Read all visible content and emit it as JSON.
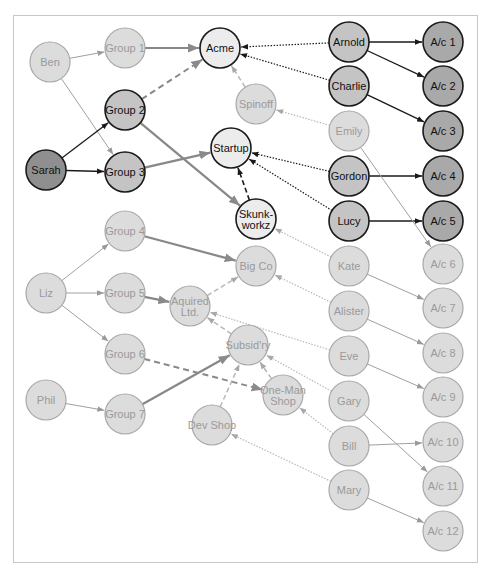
{
  "colors": {
    "dark_fill": "#8f8f8f",
    "medium_fill": "#c4c4c4",
    "light_fill": "#ececec",
    "faded_fill": "#dcdcdc",
    "faded_stroke": "#a8a8a8",
    "faded_text": "#9a9a9a",
    "strong_stroke": "#1a1a1a",
    "edge_gray": "#888888",
    "edge_light": "#b8b8b8"
  },
  "nodes": [
    {
      "id": "ben",
      "label": "Ben",
      "x": 50,
      "y": 62,
      "style": "faded"
    },
    {
      "id": "group1",
      "label": "Group 1",
      "x": 125,
      "y": 48,
      "style": "faded"
    },
    {
      "id": "acme",
      "label": "Acme",
      "x": 220,
      "y": 48,
      "style": "light"
    },
    {
      "id": "group2",
      "label": "Group 2",
      "x": 125,
      "y": 110,
      "style": "medium"
    },
    {
      "id": "sarah",
      "label": "Sarah",
      "x": 46,
      "y": 170,
      "style": "dark"
    },
    {
      "id": "group3",
      "label": "Group 3",
      "x": 125,
      "y": 172,
      "style": "medium"
    },
    {
      "id": "spinoff",
      "label": "Spinoff",
      "x": 256,
      "y": 104,
      "style": "faded"
    },
    {
      "id": "startup",
      "label": "Startup",
      "x": 231,
      "y": 148,
      "style": "light"
    },
    {
      "id": "skunkworkz",
      "label": "Skunk-|workz",
      "x": 256,
      "y": 219,
      "style": "light"
    },
    {
      "id": "arnold",
      "label": "Arnold",
      "x": 349,
      "y": 42,
      "style": "medium"
    },
    {
      "id": "charlie",
      "label": "Charlie",
      "x": 349,
      "y": 86,
      "style": "medium"
    },
    {
      "id": "emily",
      "label": "Emily",
      "x": 349,
      "y": 131,
      "style": "faded"
    },
    {
      "id": "gordon",
      "label": "Gordon",
      "x": 349,
      "y": 176,
      "style": "medium"
    },
    {
      "id": "lucy",
      "label": "Lucy",
      "x": 349,
      "y": 221,
      "style": "medium"
    },
    {
      "id": "kate",
      "label": "Kate",
      "x": 349,
      "y": 266,
      "style": "faded"
    },
    {
      "id": "alister",
      "label": "Alister",
      "x": 349,
      "y": 311,
      "style": "faded"
    },
    {
      "id": "eve",
      "label": "Eve",
      "x": 349,
      "y": 356,
      "style": "faded"
    },
    {
      "id": "gary",
      "label": "Gary",
      "x": 349,
      "y": 401,
      "style": "faded"
    },
    {
      "id": "bill",
      "label": "Bill",
      "x": 349,
      "y": 446,
      "style": "faded"
    },
    {
      "id": "mary",
      "label": "Mary",
      "x": 349,
      "y": 490,
      "style": "faded"
    },
    {
      "id": "ac1",
      "label": "A/c 1",
      "x": 443,
      "y": 42,
      "style": "accdark"
    },
    {
      "id": "ac2",
      "label": "A/c 2",
      "x": 443,
      "y": 86,
      "style": "accdark"
    },
    {
      "id": "ac3",
      "label": "A/c 3",
      "x": 443,
      "y": 131,
      "style": "accdark"
    },
    {
      "id": "ac4",
      "label": "A/c 4",
      "x": 443,
      "y": 176,
      "style": "accdark"
    },
    {
      "id": "ac5",
      "label": "A/c 5",
      "x": 443,
      "y": 221,
      "style": "accdark"
    },
    {
      "id": "ac6",
      "label": "A/c 6",
      "x": 443,
      "y": 264,
      "style": "faded"
    },
    {
      "id": "ac7",
      "label": "A/c 7",
      "x": 443,
      "y": 308,
      "style": "faded"
    },
    {
      "id": "ac8",
      "label": "A/c 8",
      "x": 443,
      "y": 353,
      "style": "faded"
    },
    {
      "id": "ac9",
      "label": "A/c 9",
      "x": 443,
      "y": 397,
      "style": "faded"
    },
    {
      "id": "ac10",
      "label": "A/c 10",
      "x": 443,
      "y": 442,
      "style": "faded"
    },
    {
      "id": "ac11",
      "label": "A/c 11",
      "x": 443,
      "y": 486,
      "style": "faded"
    },
    {
      "id": "ac12",
      "label": "A/c 12",
      "x": 443,
      "y": 531,
      "style": "faded"
    },
    {
      "id": "liz",
      "label": "Liz",
      "x": 46,
      "y": 293,
      "style": "faded"
    },
    {
      "id": "group4",
      "label": "Group 4",
      "x": 125,
      "y": 231,
      "style": "faded"
    },
    {
      "id": "group5",
      "label": "Group 5",
      "x": 125,
      "y": 293,
      "style": "faded"
    },
    {
      "id": "group6",
      "label": "Group 6",
      "x": 125,
      "y": 354,
      "style": "faded"
    },
    {
      "id": "phil",
      "label": "Phil",
      "x": 46,
      "y": 400,
      "style": "faded"
    },
    {
      "id": "group7",
      "label": "Group 7",
      "x": 125,
      "y": 414,
      "style": "faded"
    },
    {
      "id": "bigco",
      "label": "Big Co",
      "x": 256,
      "y": 266,
      "style": "faded"
    },
    {
      "id": "aquired",
      "label": "Aquired|Ltd.",
      "x": 190,
      "y": 306,
      "style": "faded"
    },
    {
      "id": "subsidry",
      "label": "Subsid'ry",
      "x": 248,
      "y": 345,
      "style": "faded"
    },
    {
      "id": "onemanshop",
      "label": "One-Man|Shop",
      "x": 283,
      "y": 395,
      "style": "faded"
    },
    {
      "id": "devshop",
      "label": "Dev Shop",
      "x": 212,
      "y": 425,
      "style": "faded"
    }
  ],
  "edges": [
    {
      "from": "ben",
      "to": "group1",
      "style": "thin-gray"
    },
    {
      "from": "ben",
      "to": "group3",
      "style": "thin-gray"
    },
    {
      "from": "group1",
      "to": "acme",
      "style": "thick-gray"
    },
    {
      "from": "sarah",
      "to": "group2",
      "style": "black"
    },
    {
      "from": "sarah",
      "to": "group3",
      "style": "black"
    },
    {
      "from": "group2",
      "to": "acme",
      "style": "dashed-gray"
    },
    {
      "from": "group2",
      "to": "skunkworkz",
      "style": "thick-gray"
    },
    {
      "from": "group3",
      "to": "startup",
      "style": "thick-gray"
    },
    {
      "from": "skunkworkz",
      "to": "startup",
      "style": "dashed-black"
    },
    {
      "from": "spinoff",
      "to": "acme",
      "style": "dashed-light"
    },
    {
      "from": "arnold",
      "to": "acme",
      "style": "dotted-black"
    },
    {
      "from": "charlie",
      "to": "acme",
      "style": "dotted-black"
    },
    {
      "from": "emily",
      "to": "spinoff",
      "style": "dotted-light"
    },
    {
      "from": "gordon",
      "to": "startup",
      "style": "dotted-black"
    },
    {
      "from": "lucy",
      "to": "startup",
      "style": "dotted-black"
    },
    {
      "from": "arnold",
      "to": "ac1",
      "style": "black"
    },
    {
      "from": "arnold",
      "to": "ac2",
      "style": "black"
    },
    {
      "from": "charlie",
      "to": "ac3",
      "style": "black"
    },
    {
      "from": "gordon",
      "to": "ac4",
      "style": "black"
    },
    {
      "from": "lucy",
      "to": "ac5",
      "style": "black"
    },
    {
      "from": "emily",
      "to": "ac6",
      "style": "thin-gray"
    },
    {
      "from": "kate",
      "to": "ac7",
      "style": "thin-gray"
    },
    {
      "from": "alister",
      "to": "ac8",
      "style": "thin-gray"
    },
    {
      "from": "eve",
      "to": "ac9",
      "style": "thin-gray"
    },
    {
      "from": "bill",
      "to": "ac10",
      "style": "thin-gray"
    },
    {
      "from": "gary",
      "to": "ac11",
      "style": "thin-gray"
    },
    {
      "from": "mary",
      "to": "ac12",
      "style": "thin-gray"
    },
    {
      "from": "kate",
      "to": "skunkworkz",
      "style": "dotted-light"
    },
    {
      "from": "alister",
      "to": "bigco",
      "style": "dotted-light"
    },
    {
      "from": "eve",
      "to": "aquired",
      "style": "dotted-light"
    },
    {
      "from": "gary",
      "to": "subsidry",
      "style": "dotted-light"
    },
    {
      "from": "bill",
      "to": "onemanshop",
      "style": "dotted-light"
    },
    {
      "from": "mary",
      "to": "devshop",
      "style": "dotted-light"
    },
    {
      "from": "liz",
      "to": "group4",
      "style": "thin-gray"
    },
    {
      "from": "liz",
      "to": "group5",
      "style": "thin-gray"
    },
    {
      "from": "liz",
      "to": "group6",
      "style": "thin-gray"
    },
    {
      "from": "phil",
      "to": "group7",
      "style": "thin-gray"
    },
    {
      "from": "group4",
      "to": "bigco",
      "style": "thick-gray"
    },
    {
      "from": "group5",
      "to": "aquired",
      "style": "thick-gray"
    },
    {
      "from": "group6",
      "to": "onemanshop",
      "style": "dashed-gray"
    },
    {
      "from": "group7",
      "to": "subsidry",
      "style": "thick-gray"
    },
    {
      "from": "aquired",
      "to": "bigco",
      "style": "dashed-light"
    },
    {
      "from": "subsidry",
      "to": "aquired",
      "style": "dashed-light"
    },
    {
      "from": "onemanshop",
      "to": "subsidry",
      "style": "dashed-light"
    },
    {
      "from": "devshop",
      "to": "subsidry",
      "style": "dashed-light"
    }
  ]
}
